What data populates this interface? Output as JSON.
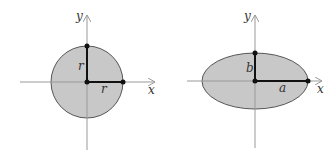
{
  "figures": [
    {
      "name": "circle",
      "x_axis_label": "x",
      "y_axis_label": "y",
      "vertical_segment_label": "r",
      "horizontal_segment_label": "r"
    },
    {
      "name": "ellipse",
      "x_axis_label": "x",
      "y_axis_label": "y",
      "vertical_segment_label": "b",
      "horizontal_segment_label": "a"
    }
  ],
  "colors": {
    "fill": "#c8c8c8",
    "outline": "#555555",
    "axis": "#999999",
    "segment": "#111111"
  }
}
